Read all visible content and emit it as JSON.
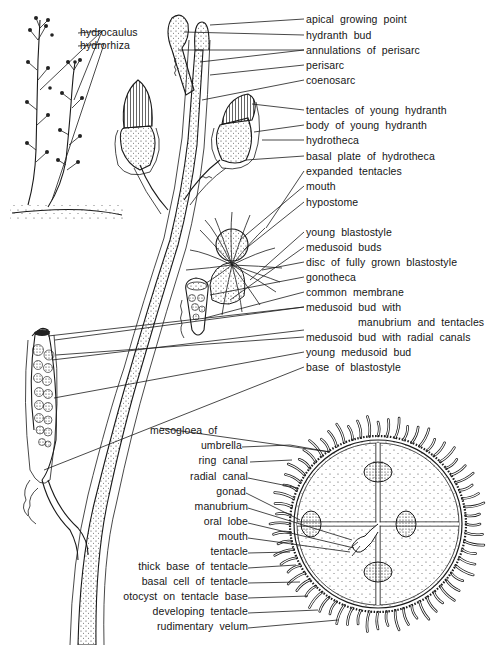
{
  "diagram": {
    "colors": {
      "ink": "#1a1a1a",
      "background": "#ffffff",
      "stipple": "#9a9a9a"
    }
  },
  "labels": {
    "inset": [
      {
        "id": "hydrocaulus",
        "text": "hydrocaulus",
        "x": 80,
        "y": 31
      },
      {
        "id": "hydrorhiza",
        "text": "hydrorhiza",
        "x": 80,
        "y": 44
      }
    ],
    "colony_right": [
      {
        "id": "apical-growing-point",
        "text": "apical growing point",
        "y": 19
      },
      {
        "id": "hydranth-bud",
        "text": "hydranth bud",
        "y": 35
      },
      {
        "id": "annulations-of-perisarc",
        "text": "annulations of perisarc",
        "y": 50
      },
      {
        "id": "perisarc",
        "text": "perisarc",
        "y": 65
      },
      {
        "id": "coenosarc",
        "text": "coenosarc",
        "y": 80
      },
      {
        "id": "tentacles-of-young-hydranth",
        "text": "tentacles of young hydranth",
        "y": 110
      },
      {
        "id": "body-of-young-hydranth",
        "text": "body of young hydranth",
        "y": 125
      },
      {
        "id": "hydrotheca",
        "text": "hydrotheca",
        "y": 140
      },
      {
        "id": "basal-plate-of-hydrotheca",
        "text": "basal plate of hydrotheca",
        "y": 156
      },
      {
        "id": "expanded-tentacles",
        "text": "expanded tentacles",
        "y": 171
      },
      {
        "id": "mouth",
        "text": "mouth",
        "y": 186
      },
      {
        "id": "hypostome",
        "text": "hypostome",
        "y": 202
      },
      {
        "id": "young-blastostyle",
        "text": "young blastostyle",
        "y": 232
      },
      {
        "id": "medusoid-buds",
        "text": "medusoid buds",
        "y": 247
      },
      {
        "id": "disc-of-fully-grown-blastostyle",
        "text": "disc of fully grown blastostyle",
        "y": 262
      },
      {
        "id": "gonotheca",
        "text": "gonotheca",
        "y": 277
      },
      {
        "id": "common-membrane",
        "text": "common membrane",
        "y": 292
      },
      {
        "id": "medusoid-bud-with-manubrium",
        "text": "medusoid bud with",
        "y": 307
      },
      {
        "id": "medusoid-bud-with-manubrium-cont",
        "text": "manubrium and tentacles",
        "y": 322,
        "indent": true
      },
      {
        "id": "medusoid-bud-with-radial-canals",
        "text": "medusoid bud with radial canals",
        "y": 337
      },
      {
        "id": "young-medusoid-bud",
        "text": "young medusoid bud",
        "y": 352
      },
      {
        "id": "base-of-blastostyle",
        "text": "base of blastostyle",
        "y": 367
      }
    ],
    "medusa_left": [
      {
        "id": "mesogloea-of",
        "text": "mesogloea of",
        "y": 430,
        "free": true
      },
      {
        "id": "umbrella",
        "text": "umbrella",
        "y": 445
      },
      {
        "id": "ring-canal",
        "text": "ring canal",
        "y": 460
      },
      {
        "id": "radial-canal",
        "text": "radial canal",
        "y": 476
      },
      {
        "id": "gonad",
        "text": "gonad",
        "y": 491
      },
      {
        "id": "manubrium",
        "text": "manubrium",
        "y": 506
      },
      {
        "id": "oral-lobe",
        "text": "oral lobe",
        "y": 521
      },
      {
        "id": "mouth-medusa",
        "text": "mouth",
        "y": 536
      },
      {
        "id": "tentacle",
        "text": "tentacle",
        "y": 551
      },
      {
        "id": "thick-base-of-tentacle",
        "text": "thick base of tentacle",
        "y": 566
      },
      {
        "id": "basal-cell-of-tentacle",
        "text": "basal cell of tentacle",
        "y": 581
      },
      {
        "id": "otocyst-on-tentacle-base",
        "text": "otocyst on tentacle base",
        "y": 596
      },
      {
        "id": "developing-tentacle",
        "text": "developing tentacle",
        "y": 611
      },
      {
        "id": "rudimentary-velum",
        "text": "rudimentary velum",
        "y": 626
      }
    ]
  }
}
